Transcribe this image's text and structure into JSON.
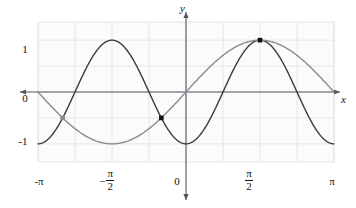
{
  "figure": {
    "background": "#ffffff",
    "plot_background": "#fbfbfb",
    "grid_color": "#e2e2ea",
    "axis_color": "#55555d",
    "curve_dark_color": "#3a3a42",
    "curve_gray_color": "#8a8a92",
    "point_color": "#111111"
  },
  "axis_labels": {
    "x": "x",
    "y": "y"
  },
  "y_ticks": [
    {
      "label": "1",
      "value": 1
    },
    {
      "label": "0",
      "value": 0
    },
    {
      "label": "-1",
      "value": -1
    }
  ],
  "x_ticks": [
    {
      "label": "-π",
      "sign": "–",
      "num": "",
      "den": "",
      "value": -3.14159265
    },
    {
      "label": "-π/2",
      "sign": "–",
      "num": "π",
      "den": "2",
      "value": -1.57079633
    },
    {
      "label": "0",
      "sign": "",
      "num": "",
      "den": "",
      "value": 0
    },
    {
      "label": "π/2",
      "sign": "",
      "num": "π",
      "den": "2",
      "value": 1.57079633
    },
    {
      "label": "π",
      "sign": "",
      "num": "",
      "den": "",
      "value": 3.14159265
    }
  ],
  "chart_data": {
    "type": "line",
    "title": "",
    "xlabel": "x",
    "ylabel": "y",
    "xlim": [
      -3.14159265,
      3.14159265
    ],
    "ylim": [
      -1.35,
      1.35
    ],
    "grid": true,
    "legend": "none",
    "x_tick_values": [
      -3.14159265,
      -1.57079633,
      0,
      1.57079633,
      3.14159265
    ],
    "x_tick_labels": [
      "-π",
      "-π/2",
      "0",
      "π/2",
      "π"
    ],
    "y_tick_values": [
      1,
      0,
      -1
    ],
    "y_tick_labels": [
      "1",
      "0",
      "-1"
    ],
    "series": [
      {
        "name": "y = -cos(2x)",
        "color": "#3a3a42",
        "expression": "-cos(2*x)",
        "width": 1.4,
        "key_points": [
          {
            "x": -3.14159265,
            "y": -1
          },
          {
            "x": -2.35619449,
            "y": 0
          },
          {
            "x": -1.57079633,
            "y": 1
          },
          {
            "x": -0.78539816,
            "y": 0
          },
          {
            "x": 0,
            "y": -1
          },
          {
            "x": 0.78539816,
            "y": 0
          },
          {
            "x": 1.57079633,
            "y": 1
          },
          {
            "x": 2.35619449,
            "y": 0
          },
          {
            "x": 3.14159265,
            "y": -1
          }
        ]
      },
      {
        "name": "y = sin(x)",
        "color": "#8a8a92",
        "expression": "sin(x)",
        "width": 1.4,
        "key_points": [
          {
            "x": -3.14159265,
            "y": 0
          },
          {
            "x": -1.57079633,
            "y": -1
          },
          {
            "x": 0,
            "y": 0
          },
          {
            "x": 1.57079633,
            "y": 1
          },
          {
            "x": 3.14159265,
            "y": 0
          }
        ]
      }
    ],
    "marked_points": [
      {
        "x": -2.61799388,
        "y": -0.5,
        "label": "",
        "style": "filled-faint"
      },
      {
        "x": -0.52359878,
        "y": -0.5,
        "label": "",
        "style": "filled"
      },
      {
        "x": 1.57079633,
        "y": 1.0,
        "label": "",
        "style": "filled"
      }
    ],
    "annotations": []
  }
}
